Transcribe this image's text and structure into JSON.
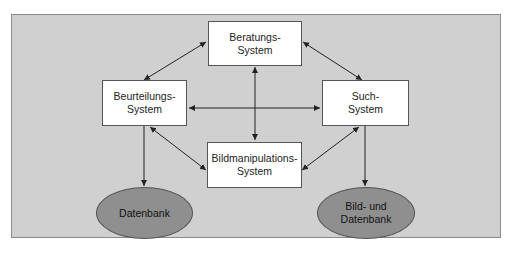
{
  "diagram": {
    "nodes": {
      "beratung": {
        "label": "Beratungs-\nSystem",
        "shape": "rectangle"
      },
      "beurteilung": {
        "label": "Beurteilungs-\nSystem",
        "shape": "rectangle"
      },
      "such": {
        "label": "Such-\nSystem",
        "shape": "rectangle"
      },
      "bildmanipulation": {
        "label": "Bildmanipulations-\nSystem",
        "shape": "rectangle"
      },
      "datenbank": {
        "label": "Datenbank",
        "shape": "ellipse"
      },
      "bild_datenbank": {
        "label": "Bild- und\nDatenbank",
        "shape": "ellipse"
      }
    },
    "edges": [
      {
        "from": "beratung",
        "to": "beurteilung",
        "direction": "both"
      },
      {
        "from": "beratung",
        "to": "such",
        "direction": "both"
      },
      {
        "from": "beratung",
        "to": "bildmanipulation",
        "direction": "both"
      },
      {
        "from": "beurteilung",
        "to": "such",
        "direction": "both"
      },
      {
        "from": "beurteilung",
        "to": "bildmanipulation",
        "direction": "both"
      },
      {
        "from": "such",
        "to": "bildmanipulation",
        "direction": "both"
      },
      {
        "from": "beurteilung",
        "to": "datenbank",
        "direction": "forward"
      },
      {
        "from": "such",
        "to": "bild_datenbank",
        "direction": "forward"
      }
    ],
    "colors": {
      "background": "#d0d0d0",
      "box": "#ffffff",
      "ellipse": "#8f8f8f",
      "line": "#222222"
    }
  }
}
